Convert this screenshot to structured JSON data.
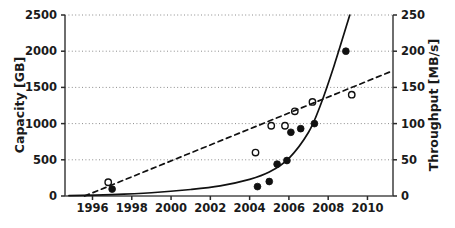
{
  "chart_data": {
    "type": "scatter",
    "title": "",
    "subtitle": "",
    "xlabel": "",
    "ylabel": "Capacity [GB]",
    "y2label": "Throughput [MB/s]",
    "xlim": [
      1994.6,
      2011.3
    ],
    "ylim": [
      0,
      2500
    ],
    "y2lim": [
      0,
      250
    ],
    "grid": true,
    "grid_style": "dotted",
    "legend": "none",
    "xticks": [
      1996,
      1998,
      2000,
      2002,
      2004,
      2006,
      2008,
      2010
    ],
    "xtick_labels": [
      "1996",
      "1998",
      "2000",
      "2002",
      "2004",
      "2006",
      "2008",
      "2010"
    ],
    "yticks": [
      0,
      500,
      1000,
      1500,
      2000,
      2500
    ],
    "ytick_labels": [
      "0",
      "500",
      "1000",
      "1500",
      "2000",
      "2500"
    ],
    "y2ticks": [
      0,
      50,
      100,
      150,
      200,
      250
    ],
    "y2tick_labels": [
      "0",
      "50",
      "100",
      "150",
      "200",
      "250"
    ],
    "series": [
      {
        "name": "Capacity [GB] (filled markers)",
        "marker": "filled-circle",
        "axis": "left",
        "color": "#111111",
        "points": [
          {
            "x": 1997.0,
            "y": 95
          },
          {
            "x": 2004.4,
            "y": 130
          },
          {
            "x": 2005.0,
            "y": 200
          },
          {
            "x": 2005.4,
            "y": 440
          },
          {
            "x": 2005.9,
            "y": 490
          },
          {
            "x": 2006.1,
            "y": 880
          },
          {
            "x": 2006.6,
            "y": 930
          },
          {
            "x": 2007.3,
            "y": 1000
          },
          {
            "x": 2008.9,
            "y": 2000
          }
        ]
      },
      {
        "name": "Throughput [MB/s] (open markers)",
        "marker": "open-circle",
        "axis": "right",
        "color": "#111111",
        "points": [
          {
            "x": 1996.8,
            "y": 19
          },
          {
            "x": 2004.3,
            "y": 60
          },
          {
            "x": 2005.1,
            "y": 97
          },
          {
            "x": 2005.8,
            "y": 97
          },
          {
            "x": 2006.3,
            "y": 117
          },
          {
            "x": 2007.2,
            "y": 130
          },
          {
            "x": 2009.2,
            "y": 140
          }
        ]
      },
      {
        "name": "Capacity trend (solid curve)",
        "marker": "none",
        "linestyle": "solid",
        "axis": "left",
        "color": "#111111",
        "points": [
          {
            "x": 1994.8,
            "y": 5
          },
          {
            "x": 1997.0,
            "y": 20
          },
          {
            "x": 1999.0,
            "y": 45
          },
          {
            "x": 2001.0,
            "y": 90
          },
          {
            "x": 2002.5,
            "y": 140
          },
          {
            "x": 2004.0,
            "y": 230
          },
          {
            "x": 2005.0,
            "y": 330
          },
          {
            "x": 2006.0,
            "y": 520
          },
          {
            "x": 2007.0,
            "y": 880
          },
          {
            "x": 2007.6,
            "y": 1250
          },
          {
            "x": 2008.3,
            "y": 1800
          },
          {
            "x": 2009.1,
            "y": 2500
          }
        ]
      },
      {
        "name": "Throughput trend (dashed line)",
        "marker": "none",
        "linestyle": "dashed",
        "axis": "right",
        "color": "#111111",
        "points": [
          {
            "x": 1995.6,
            "y": 0
          },
          {
            "x": 2011.2,
            "y": 172
          }
        ]
      }
    ]
  }
}
